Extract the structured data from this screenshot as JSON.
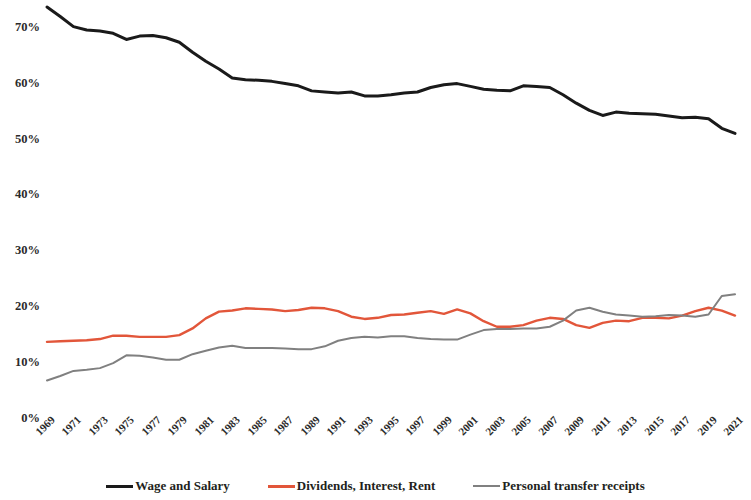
{
  "chart_data": {
    "type": "line",
    "title": "",
    "subtitle": "",
    "xlabel": "",
    "ylabel": "",
    "ylim": [
      0,
      75
    ],
    "xlim": [
      1969,
      2021
    ],
    "grid": false,
    "legend_position": "bottom",
    "y_ticks": [
      "0%",
      "10%",
      "20%",
      "30%",
      "40%",
      "50%",
      "60%",
      "70%"
    ],
    "y_tick_values": [
      0,
      10,
      20,
      30,
      40,
      50,
      60,
      70
    ],
    "x_ticks": [
      "1969",
      "1971",
      "1973",
      "1975",
      "1977",
      "1979",
      "1981",
      "1983",
      "1985",
      "1987",
      "1989",
      "1991",
      "1993",
      "1995",
      "1997",
      "1999",
      "2001",
      "2003",
      "2005",
      "2007",
      "2009",
      "2011",
      "2013",
      "2015",
      "2017",
      "2019",
      "2021"
    ],
    "x": [
      1969,
      1970,
      1971,
      1972,
      1973,
      1974,
      1975,
      1976,
      1977,
      1978,
      1979,
      1980,
      1981,
      1982,
      1983,
      1984,
      1985,
      1986,
      1987,
      1988,
      1989,
      1990,
      1991,
      1992,
      1993,
      1994,
      1995,
      1996,
      1997,
      1998,
      1999,
      2000,
      2001,
      2002,
      2003,
      2004,
      2005,
      2006,
      2007,
      2008,
      2009,
      2010,
      2011,
      2012,
      2013,
      2014,
      2015,
      2016,
      2017,
      2018,
      2019,
      2020,
      2021
    ],
    "series": [
      {
        "name": "Wage and Salary",
        "color": "#1a1a1a",
        "width": 3.0,
        "values": [
          73.7,
          72.0,
          70.2,
          69.6,
          69.4,
          69.0,
          67.9,
          68.5,
          68.6,
          68.2,
          67.4,
          65.6,
          64.0,
          62.6,
          61.0,
          60.7,
          60.6,
          60.4,
          60.0,
          59.6,
          58.7,
          58.5,
          58.3,
          58.5,
          57.8,
          57.8,
          58.0,
          58.3,
          58.5,
          59.3,
          59.8,
          60.0,
          59.5,
          59.0,
          58.8,
          58.7,
          59.6,
          59.5,
          59.3,
          58.0,
          56.5,
          55.2,
          54.3,
          54.9,
          54.7,
          54.6,
          54.5,
          54.2,
          53.9,
          54.0,
          53.7,
          52.0,
          51.1
        ]
      },
      {
        "name": "Dividends, Interest, Rent",
        "color": "#e2563a",
        "width": 2.4,
        "values": [
          13.8,
          13.9,
          14.0,
          14.1,
          14.3,
          14.9,
          14.9,
          14.7,
          14.7,
          14.7,
          15.0,
          16.2,
          18.0,
          19.2,
          19.4,
          19.8,
          19.7,
          19.6,
          19.3,
          19.5,
          19.9,
          19.8,
          19.3,
          18.3,
          17.9,
          18.1,
          18.6,
          18.7,
          19.0,
          19.3,
          18.8,
          19.6,
          18.9,
          17.5,
          16.5,
          16.5,
          16.8,
          17.6,
          18.1,
          17.9,
          16.8,
          16.3,
          17.2,
          17.6,
          17.5,
          18.1,
          18.1,
          18.0,
          18.5,
          19.3,
          19.9,
          19.4,
          18.5
        ]
      },
      {
        "name": "Personal transfer receipts",
        "color": "#808080",
        "width": 2.0,
        "values": [
          6.9,
          7.7,
          8.6,
          8.8,
          9.1,
          10.0,
          11.4,
          11.3,
          11.0,
          10.6,
          10.6,
          11.6,
          12.2,
          12.8,
          13.1,
          12.7,
          12.7,
          12.7,
          12.6,
          12.5,
          12.5,
          13.0,
          14.0,
          14.5,
          14.7,
          14.6,
          14.8,
          14.8,
          14.5,
          14.3,
          14.2,
          14.2,
          15.1,
          15.9,
          16.1,
          16.1,
          16.2,
          16.2,
          16.5,
          17.6,
          19.4,
          19.9,
          19.2,
          18.7,
          18.5,
          18.3,
          18.4,
          18.6,
          18.5,
          18.3,
          18.7,
          22.0,
          22.3
        ]
      }
    ]
  },
  "legend": {
    "items": [
      {
        "label": "Wage and Salary",
        "color": "#1a1a1a"
      },
      {
        "label": "Dividends, Interest, Rent",
        "color": "#e2563a"
      },
      {
        "label": "Personal transfer receipts",
        "color": "#808080"
      }
    ]
  }
}
